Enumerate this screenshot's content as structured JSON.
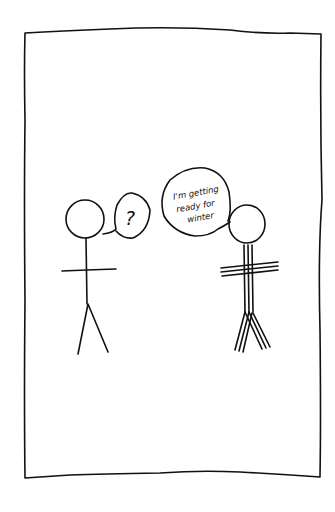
{
  "comic": {
    "panel_count": 1,
    "background": "#ffffff",
    "ink_color": "#111111",
    "left_figure": {
      "description": "plain stick figure",
      "speech_bubble": "?"
    },
    "right_figure": {
      "description": "stick figure drawn with triple lines (bundled up)",
      "speech_bubble": {
        "line1": "I'm getting",
        "line2": "ready for",
        "line3": "winter"
      }
    }
  }
}
